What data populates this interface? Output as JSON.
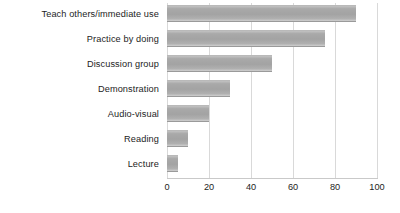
{
  "chart_data": {
    "type": "bar",
    "orientation": "horizontal",
    "title": "",
    "subtitle": "",
    "xlabel": "",
    "ylabel": "",
    "categories": [
      "Teach others/immediate use",
      "Practice by doing",
      "Discussion group",
      "Demonstration",
      "Audio-visual",
      "Reading",
      "Lecture"
    ],
    "values": [
      90,
      75,
      50,
      30,
      20,
      10,
      5
    ],
    "xlim": [
      0,
      100
    ],
    "xticks": [
      0,
      20,
      40,
      60,
      80,
      100
    ],
    "xtick_labels": [
      "0",
      "20",
      "40",
      "60",
      "80",
      "100"
    ],
    "grid": "vertical",
    "legend": "none",
    "series": [
      {
        "name": "Retention rate",
        "values": [
          90,
          75,
          50,
          30,
          20,
          10,
          5
        ]
      }
    ],
    "annotations": []
  },
  "colors": {
    "bar_fill": "#a8a8a8",
    "bar_highlight": "#c2c2c2",
    "gridline": "#d9d9d9",
    "axis": "#c9c9c9",
    "text": "#1d1d1d",
    "background": "#ffffff"
  }
}
